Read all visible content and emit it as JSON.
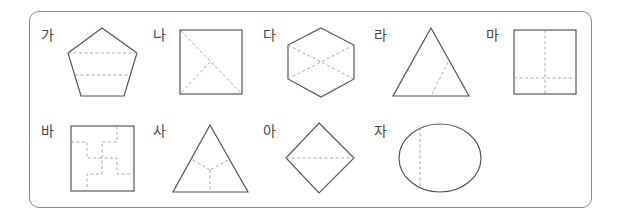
{
  "figure": {
    "items": [
      {
        "label": "가",
        "shape": "pentagon"
      },
      {
        "label": "나",
        "shape": "square"
      },
      {
        "label": "다",
        "shape": "hexagon"
      },
      {
        "label": "라",
        "shape": "triangle"
      },
      {
        "label": "마",
        "shape": "square"
      },
      {
        "label": "바",
        "shape": "square"
      },
      {
        "label": "사",
        "shape": "triangle"
      },
      {
        "label": "아",
        "shape": "diamond"
      },
      {
        "label": "자",
        "shape": "ellipse"
      }
    ],
    "colors": {
      "outline": "#555555",
      "dashed": "#a8a8a8",
      "frame": "#8a8a8a"
    }
  }
}
